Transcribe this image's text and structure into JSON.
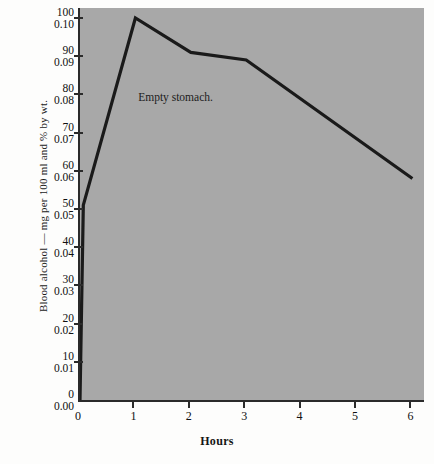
{
  "figure": {
    "background_color": "#fdfdfc",
    "plot_background_color": "#a8a8a8",
    "axis_color": "#2b2b2b",
    "line_color": "#1a1a1a"
  },
  "annotation": {
    "text": "Empty stomach."
  },
  "chart_data": {
    "type": "line",
    "title": "",
    "subtitle": "",
    "xlabel": "Hours",
    "ylabel": "Blood alcohol — mg per 100 ml and % by wt.",
    "xlim": [
      0,
      6.1
    ],
    "ylim": [
      0,
      105
    ],
    "grid": false,
    "legend": null,
    "x_ticks": [
      0,
      1,
      2,
      3,
      4,
      5,
      6
    ],
    "x_tick_labels": [
      "0",
      "1",
      "2",
      "3",
      "4",
      "5",
      "6"
    ],
    "y_ticks": [
      0,
      10,
      20,
      30,
      40,
      50,
      60,
      70,
      80,
      90,
      100
    ],
    "y_tick_labels_mg": [
      "0",
      "10",
      "20",
      "30",
      "40",
      "50",
      "60",
      "70",
      "80",
      "90",
      "100"
    ],
    "y_tick_labels_pct": [
      "0.00",
      "0.01",
      "0.02",
      "0.03",
      "0.04",
      "0.05",
      "0.06",
      "0.07",
      "0.08",
      "0.09",
      "0.10"
    ],
    "series": [
      {
        "name": "Empty stomach.",
        "x": [
          0,
          0.06,
          1.0,
          2.0,
          3.0,
          6.0
        ],
        "y": [
          0,
          51,
          100,
          91,
          89,
          58
        ]
      }
    ],
    "annotations": [
      {
        "text": "Empty stomach.",
        "x": 1.05,
        "y": 79
      }
    ]
  }
}
